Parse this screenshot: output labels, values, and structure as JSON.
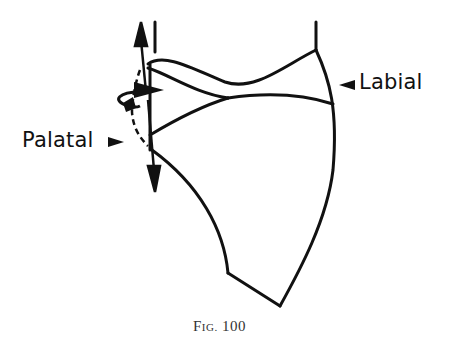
{
  "figure": {
    "caption_prefix": "F",
    "caption_smallcaps": "IG.",
    "caption_number": "100",
    "labels": {
      "labial": "Labial",
      "palatal": "Palatal"
    },
    "colors": {
      "line": "#111111",
      "background": "#ffffff"
    },
    "elements": [
      "tooth-outline",
      "vertical-axis-double-arrow",
      "rotation-arrow",
      "dashed-path",
      "labial-pointer",
      "palatal-pointer"
    ]
  }
}
